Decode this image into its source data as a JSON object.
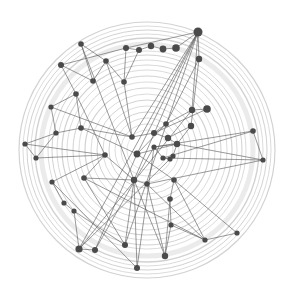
{
  "diagram": {
    "type": "network-graph",
    "background": "#ffffff",
    "ring_color": "#d2d2d2",
    "edge_color": "#555555",
    "node_color": "#4a4a4a",
    "center": [
      147,
      150
    ],
    "rings": [
      {
        "r": 128,
        "w": 1.2
      },
      {
        "r": 124,
        "w": 0.8
      },
      {
        "r": 120,
        "w": 1.0
      },
      {
        "r": 116,
        "w": 0.8
      },
      {
        "r": 112,
        "w": 1.4
      },
      {
        "r": 106,
        "w": 5
      },
      {
        "r": 99,
        "w": 0.8
      },
      {
        "r": 95,
        "w": 1.0
      },
      {
        "r": 90,
        "w": 0.8
      },
      {
        "r": 85,
        "w": 1.2
      },
      {
        "r": 80,
        "w": 0.8
      },
      {
        "r": 74,
        "w": 1.0
      },
      {
        "r": 68,
        "w": 0.8
      },
      {
        "r": 62,
        "w": 1.2
      },
      {
        "r": 56,
        "w": 0.8
      },
      {
        "r": 50,
        "w": 1.0
      },
      {
        "r": 44,
        "w": 0.8
      },
      {
        "r": 38,
        "w": 1.0
      },
      {
        "r": 32,
        "w": 0.8
      },
      {
        "r": 26,
        "w": 0.8
      },
      {
        "r": 20,
        "w": 0.6
      }
    ],
    "nodes": [
      {
        "id": 0,
        "x": 198,
        "y": 32,
        "r": 4.5
      },
      {
        "id": 1,
        "x": 81,
        "y": 44,
        "r": 2.8
      },
      {
        "id": 2,
        "x": 126,
        "y": 48,
        "r": 3
      },
      {
        "id": 3,
        "x": 139,
        "y": 50,
        "r": 3
      },
      {
        "id": 4,
        "x": 151,
        "y": 46,
        "r": 3.2
      },
      {
        "id": 5,
        "x": 163,
        "y": 49,
        "r": 3.4
      },
      {
        "id": 6,
        "x": 176,
        "y": 48,
        "r": 3.8
      },
      {
        "id": 7,
        "x": 199,
        "y": 59,
        "r": 3.2
      },
      {
        "id": 8,
        "x": 61,
        "y": 65,
        "r": 3
      },
      {
        "id": 9,
        "x": 106,
        "y": 61,
        "r": 2.8
      },
      {
        "id": 10,
        "x": 93,
        "y": 81,
        "r": 2.8
      },
      {
        "id": 11,
        "x": 124,
        "y": 82,
        "r": 2.8
      },
      {
        "id": 12,
        "x": 76,
        "y": 94,
        "r": 2.8
      },
      {
        "id": 13,
        "x": 51,
        "y": 107,
        "r": 2.6
      },
      {
        "id": 14,
        "x": 192,
        "y": 110,
        "r": 3.2
      },
      {
        "id": 15,
        "x": 207,
        "y": 109,
        "r": 3.8
      },
      {
        "id": 16,
        "x": 166,
        "y": 124,
        "r": 2.8
      },
      {
        "id": 17,
        "x": 191,
        "y": 126,
        "r": 3.2
      },
      {
        "id": 18,
        "x": 81,
        "y": 128,
        "r": 2.8
      },
      {
        "id": 19,
        "x": 56,
        "y": 133,
        "r": 2.6
      },
      {
        "id": 20,
        "x": 132,
        "y": 137,
        "r": 2.8
      },
      {
        "id": 21,
        "x": 154,
        "y": 133,
        "r": 3
      },
      {
        "id": 22,
        "x": 168,
        "y": 138,
        "r": 3.2
      },
      {
        "id": 23,
        "x": 253,
        "y": 131,
        "r": 2.8
      },
      {
        "id": 24,
        "x": 25,
        "y": 144,
        "r": 2.6
      },
      {
        "id": 25,
        "x": 177,
        "y": 144,
        "r": 3.2
      },
      {
        "id": 26,
        "x": 154,
        "y": 147,
        "r": 2.6
      },
      {
        "id": 27,
        "x": 137,
        "y": 154,
        "r": 3.4
      },
      {
        "id": 28,
        "x": 105,
        "y": 155,
        "r": 2.8
      },
      {
        "id": 29,
        "x": 36,
        "y": 158,
        "r": 2.6
      },
      {
        "id": 30,
        "x": 263,
        "y": 160,
        "r": 2.6
      },
      {
        "id": 31,
        "x": 163,
        "y": 158,
        "r": 2.6
      },
      {
        "id": 32,
        "x": 170,
        "y": 159,
        "r": 2.6
      },
      {
        "id": 33,
        "x": 173,
        "y": 156,
        "r": 2.6
      },
      {
        "id": 34,
        "x": 84,
        "y": 178,
        "r": 2.8
      },
      {
        "id": 35,
        "x": 52,
        "y": 182,
        "r": 2.6
      },
      {
        "id": 36,
        "x": 134,
        "y": 180,
        "r": 3.2
      },
      {
        "id": 37,
        "x": 147,
        "y": 184,
        "r": 2.8
      },
      {
        "id": 38,
        "x": 174,
        "y": 180,
        "r": 2.8
      },
      {
        "id": 39,
        "x": 170,
        "y": 199,
        "r": 2.8
      },
      {
        "id": 40,
        "x": 64,
        "y": 203,
        "r": 2.6
      },
      {
        "id": 41,
        "x": 74,
        "y": 211,
        "r": 2.6
      },
      {
        "id": 42,
        "x": 171,
        "y": 225,
        "r": 2.6
      },
      {
        "id": 43,
        "x": 237,
        "y": 233,
        "r": 2.6
      },
      {
        "id": 44,
        "x": 205,
        "y": 240,
        "r": 2.6
      },
      {
        "id": 45,
        "x": 125,
        "y": 245,
        "r": 3
      },
      {
        "id": 46,
        "x": 79,
        "y": 249,
        "r": 3.6
      },
      {
        "id": 47,
        "x": 95,
        "y": 250,
        "r": 3
      },
      {
        "id": 48,
        "x": 165,
        "y": 256,
        "r": 3.2
      },
      {
        "id": 49,
        "x": 137,
        "y": 268,
        "r": 3
      }
    ],
    "edges": [
      [
        0,
        2
      ],
      [
        2,
        3
      ],
      [
        3,
        4
      ],
      [
        4,
        5
      ],
      [
        5,
        6
      ],
      [
        6,
        0
      ],
      [
        0,
        7
      ],
      [
        0,
        14
      ],
      [
        0,
        27
      ],
      [
        0,
        36
      ],
      [
        0,
        45
      ],
      [
        0,
        46
      ],
      [
        0,
        20
      ],
      [
        7,
        17
      ],
      [
        7,
        16
      ],
      [
        2,
        11
      ],
      [
        3,
        11
      ],
      [
        2,
        8
      ],
      [
        8,
        10
      ],
      [
        8,
        12
      ],
      [
        1,
        10
      ],
      [
        1,
        9
      ],
      [
        1,
        36
      ],
      [
        9,
        11
      ],
      [
        9,
        10
      ],
      [
        9,
        20
      ],
      [
        12,
        13
      ],
      [
        12,
        18
      ],
      [
        12,
        28
      ],
      [
        13,
        20
      ],
      [
        13,
        19
      ],
      [
        19,
        18
      ],
      [
        18,
        20
      ],
      [
        18,
        27
      ],
      [
        24,
        19
      ],
      [
        24,
        28
      ],
      [
        24,
        29
      ],
      [
        29,
        19
      ],
      [
        29,
        28
      ],
      [
        28,
        36
      ],
      [
        35,
        28
      ],
      [
        35,
        40
      ],
      [
        35,
        49
      ],
      [
        34,
        36
      ],
      [
        34,
        28
      ],
      [
        34,
        45
      ],
      [
        40,
        41
      ],
      [
        41,
        46
      ],
      [
        41,
        45
      ],
      [
        46,
        47
      ],
      [
        47,
        27
      ],
      [
        47,
        26
      ],
      [
        46,
        14
      ],
      [
        45,
        36
      ],
      [
        36,
        49
      ],
      [
        36,
        48
      ],
      [
        27,
        38
      ],
      [
        27,
        16
      ],
      [
        27,
        25
      ],
      [
        14,
        15
      ],
      [
        14,
        16
      ],
      [
        15,
        21
      ],
      [
        16,
        21
      ],
      [
        17,
        25
      ],
      [
        17,
        22
      ],
      [
        21,
        22
      ],
      [
        22,
        25
      ],
      [
        25,
        26
      ],
      [
        26,
        31
      ],
      [
        31,
        32
      ],
      [
        32,
        33
      ],
      [
        33,
        25
      ],
      [
        23,
        30
      ],
      [
        23,
        26
      ],
      [
        30,
        25
      ],
      [
        30,
        31
      ],
      [
        30,
        37
      ],
      [
        31,
        23
      ],
      [
        38,
        39
      ],
      [
        39,
        42
      ],
      [
        38,
        43
      ],
      [
        38,
        44
      ],
      [
        42,
        44
      ],
      [
        44,
        43
      ],
      [
        37,
        48
      ],
      [
        37,
        44
      ],
      [
        37,
        36
      ],
      [
        39,
        48
      ],
      [
        42,
        48
      ],
      [
        34,
        44
      ],
      [
        26,
        49
      ],
      [
        33,
        46
      ],
      [
        20,
        21
      ],
      [
        11,
        20
      ]
    ]
  }
}
